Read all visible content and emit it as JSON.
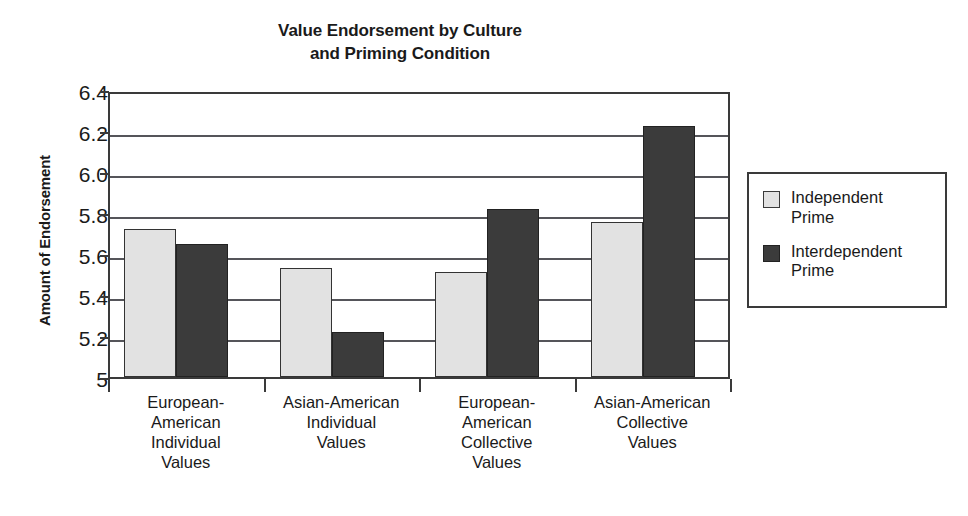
{
  "chart_data": {
    "type": "bar",
    "title": "Value Endorsement by Culture and Priming Condition",
    "title_lines": [
      "Value Endorsement by Culture",
      "and Priming Condition"
    ],
    "xlabel": "",
    "ylabel": "Amount of Endorsement",
    "ylim": [
      5,
      6.4
    ],
    "grid": true,
    "legend_position": "right",
    "ytick_labels": [
      "6.4",
      "6.2",
      "6.0",
      "5.8",
      "5.6",
      "5.4",
      "5.2",
      "5"
    ],
    "ytick_values": [
      6.4,
      6.2,
      6.0,
      5.8,
      5.6,
      5.4,
      5.2,
      5.0
    ],
    "categories": [
      "European-American Individual Values",
      "Asian-American Individual Values",
      "European-American Collective Values",
      "Asian-American Collective Values"
    ],
    "category_lines": [
      [
        "European-",
        "American",
        "Individual",
        "Values"
      ],
      [
        "Asian-American",
        "Individual",
        "Values"
      ],
      [
        "European-",
        "American",
        "Collective",
        "Values"
      ],
      [
        "Asian-American",
        "Collective",
        "Values"
      ]
    ],
    "series": [
      {
        "name": "Independent Prime",
        "name_lines": [
          "Independent",
          "Prime"
        ],
        "color": "#e2e2e2",
        "values": [
          5.72,
          5.53,
          5.51,
          5.755
        ]
      },
      {
        "name": "Interdependent Prime",
        "name_lines": [
          "Interdependent",
          "Prime"
        ],
        "color": "#3b3b3b",
        "values": [
          5.65,
          5.22,
          5.82,
          6.225
        ]
      }
    ]
  },
  "colors": {
    "independent_prime": "#e2e2e2",
    "interdependent_prime": "#3b3b3b",
    "axis": "#3a3a3a",
    "gridline": "#55555a",
    "text": "#1a1a1a",
    "background": "#ffffff"
  },
  "legend": {
    "entries": [
      {
        "label": "Independent Prime",
        "lines": [
          "Independent",
          "Prime"
        ],
        "swatch": "light"
      },
      {
        "label": "Interdependent Prime",
        "lines": [
          "Interdependent",
          "Prime"
        ],
        "swatch": "dark"
      }
    ]
  }
}
